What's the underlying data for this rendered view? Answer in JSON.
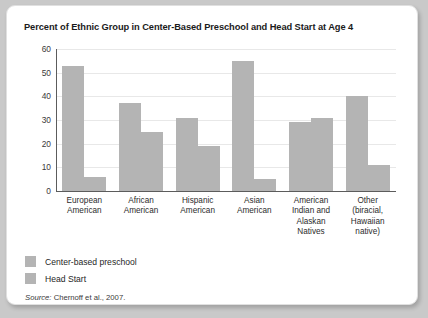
{
  "title": "Percent of Ethnic Group in Center-Based Preschool and Head Start at Age 4",
  "source": {
    "label": "Source:",
    "text": "Chernoff et al., 2007."
  },
  "legend": [
    {
      "name": "Center-based preschool",
      "color": "#b4b4b4"
    },
    {
      "name": "Head Start",
      "color": "#b4b4b4"
    }
  ],
  "chart_data": {
    "type": "bar",
    "title": "Percent of Ethnic Group in Center-Based Preschool and Head Start at Age 4",
    "xlabel": "",
    "ylabel": "",
    "ylim": [
      0,
      60
    ],
    "yticks": [
      0,
      10,
      20,
      30,
      40,
      50,
      60
    ],
    "grid": true,
    "legend_position": "bottom-left",
    "categories": [
      "European American",
      "African American",
      "Hispanic American",
      "Asian American",
      "American Indian and Alaskan Natives",
      "Other (biracial, Hawaiian native)"
    ],
    "category_lines": [
      [
        "European",
        "American"
      ],
      [
        "African",
        "American"
      ],
      [
        "Hispanic",
        "American"
      ],
      [
        "Asian",
        "American"
      ],
      [
        "American",
        "Indian and",
        "Alaskan",
        "Natives"
      ],
      [
        "Other",
        "(biracial,",
        "Hawaiian",
        "native)"
      ]
    ],
    "series": [
      {
        "name": "Center-based preschool",
        "color": "#b4b4b4",
        "values": [
          53,
          37,
          31,
          55,
          29,
          40
        ]
      },
      {
        "name": "Head Start",
        "color": "#b4b4b4",
        "values": [
          6,
          25,
          19,
          5,
          31,
          11
        ]
      }
    ]
  }
}
